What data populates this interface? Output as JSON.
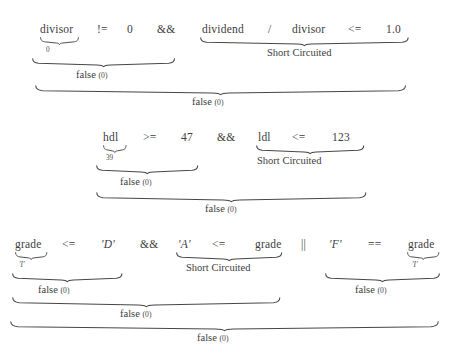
{
  "figure": {
    "text_color": "#3d3d3d",
    "brace_color": "#474747",
    "background": "#ffffff",
    "labels": {
      "false_word": "false",
      "false_paren": "(0)",
      "short_circuited": "Short Circuited"
    }
  },
  "expressions": [
    {
      "id": "expr-1",
      "tokens": [
        {
          "text": "divisor",
          "kind": "ident"
        },
        {
          "text": "!=",
          "kind": "op"
        },
        {
          "text": "0",
          "kind": "ident"
        },
        {
          "text": "&&",
          "kind": "op"
        },
        {
          "text": "dividend",
          "kind": "ident"
        },
        {
          "text": "/",
          "kind": "op"
        },
        {
          "text": "divisor",
          "kind": "ident"
        },
        {
          "text": "<=",
          "kind": "op"
        },
        {
          "text": "1.0",
          "kind": "ident"
        }
      ],
      "annotations": [
        {
          "target": "divisor",
          "value": "0",
          "kind": "num"
        }
      ],
      "braces": [
        {
          "level": 1,
          "label": "false",
          "paren": "(0)",
          "span": "divisor != 0"
        },
        {
          "level": 1,
          "label": "Short Circuited",
          "paren": "",
          "span": "dividend / divisor <= 1.0"
        },
        {
          "level": 2,
          "label": "false",
          "paren": "(0)",
          "span": "whole expression"
        }
      ]
    },
    {
      "id": "expr-2",
      "tokens": [
        {
          "text": "hdl",
          "kind": "ident"
        },
        {
          "text": ">=",
          "kind": "op"
        },
        {
          "text": "47",
          "kind": "ident"
        },
        {
          "text": "&&",
          "kind": "op"
        },
        {
          "text": "ldl",
          "kind": "ident"
        },
        {
          "text": "<=",
          "kind": "op"
        },
        {
          "text": "123",
          "kind": "ident"
        }
      ],
      "annotations": [
        {
          "target": "hdl",
          "value": "39",
          "kind": "num"
        }
      ],
      "braces": [
        {
          "level": 1,
          "label": "false",
          "paren": "(0)",
          "span": "hdl >= 47"
        },
        {
          "level": 1,
          "label": "Short Circuited",
          "paren": "",
          "span": "ldl <= 123"
        },
        {
          "level": 2,
          "label": "false",
          "paren": "(0)",
          "span": "whole expression"
        }
      ]
    },
    {
      "id": "expr-3",
      "tokens": [
        {
          "text": "grade",
          "kind": "ident"
        },
        {
          "text": "<=",
          "kind": "op"
        },
        {
          "text": "'D'",
          "kind": "chr"
        },
        {
          "text": "&&",
          "kind": "op"
        },
        {
          "text": "'A'",
          "kind": "chr"
        },
        {
          "text": "<=",
          "kind": "op"
        },
        {
          "text": "grade",
          "kind": "ident"
        },
        {
          "text": "||",
          "kind": "op"
        },
        {
          "text": "'F'",
          "kind": "chr"
        },
        {
          "text": "==",
          "kind": "op"
        },
        {
          "text": "grade",
          "kind": "ident"
        }
      ],
      "annotations": [
        {
          "target": "grade-left",
          "value": "'I'",
          "kind": "chr"
        },
        {
          "target": "grade-right",
          "value": "'I'",
          "kind": "chr"
        }
      ],
      "braces": [
        {
          "level": 1,
          "label": "false",
          "paren": "(0)",
          "span": "grade <= 'D'"
        },
        {
          "level": 1,
          "label": "Short Circuited",
          "paren": "",
          "span": "'A' <= grade"
        },
        {
          "level": 1,
          "label": "false",
          "paren": "(0)",
          "span": "'F' == grade"
        },
        {
          "level": 2,
          "label": "false",
          "paren": "(0)",
          "span": "grade <= 'D' && 'A' <= grade"
        },
        {
          "level": 3,
          "label": "false",
          "paren": "(0)",
          "span": "whole expression"
        }
      ]
    }
  ]
}
